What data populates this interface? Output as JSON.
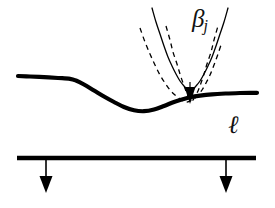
{
  "figure": {
    "background_color": "#ffffff",
    "ink_color": "#000000",
    "width": 275,
    "height": 208,
    "labels": {
      "beta_symbol": "β",
      "beta_subscript": "j",
      "beta_full": "βj",
      "ell": "ℓ"
    }
  },
  "chart_data": {
    "type": "line",
    "xlabel": "",
    "ylabel": "",
    "xlim": [
      0,
      275
    ],
    "ylim": [
      208,
      0
    ],
    "grid": false,
    "legend": "none",
    "coordinate_note": "Pixel coordinates, y increases downward",
    "annotations": [
      {
        "text": "βj",
        "x": 200,
        "y": 22,
        "style": "italic",
        "role": "parabola-family-label"
      },
      {
        "text": "ℓ",
        "x": 234,
        "y": 125,
        "style": "script-italic",
        "role": "baseline-label"
      }
    ],
    "series": [
      {
        "name": "obstacle-curve",
        "style": "solid",
        "stroke_width": 4.2,
        "color": "#000000",
        "points": [
          [
            18,
            76
          ],
          [
            30,
            76.5
          ],
          [
            44,
            77.2
          ],
          [
            58,
            78.0
          ],
          [
            70,
            78.8
          ],
          [
            76,
            80.5
          ],
          [
            84,
            84.5
          ],
          [
            94,
            90.5
          ],
          [
            104,
            96.5
          ],
          [
            114,
            102
          ],
          [
            124,
            107
          ],
          [
            134,
            110.3
          ],
          [
            144,
            111.2
          ],
          [
            154,
            109.5
          ],
          [
            164,
            106
          ],
          [
            174,
            102
          ],
          [
            182,
            99.5
          ],
          [
            190,
            97.3
          ],
          [
            200,
            95.6
          ],
          [
            212,
            94.3
          ],
          [
            226,
            93.5
          ],
          [
            240,
            93.0
          ],
          [
            250,
            92.8
          ],
          [
            257,
            92.8
          ]
        ]
      },
      {
        "name": "parabola-solid",
        "style": "solid",
        "stroke_width": 1.3,
        "color": "#000000",
        "vertex": [
          190,
          90
        ],
        "points": [
          [
            152,
            8
          ],
          [
            156,
            22
          ],
          [
            160,
            34
          ],
          [
            164,
            46
          ],
          [
            168,
            57
          ],
          [
            172,
            66
          ],
          [
            176,
            74
          ],
          [
            180,
            81
          ],
          [
            184,
            86
          ],
          [
            187,
            89
          ],
          [
            190,
            90
          ],
          [
            193,
            89
          ],
          [
            196,
            86
          ],
          [
            200,
            81
          ],
          [
            204,
            74
          ],
          [
            208,
            66
          ],
          [
            212,
            57
          ],
          [
            216,
            46
          ],
          [
            220,
            34
          ],
          [
            224,
            22
          ],
          [
            228,
            8
          ]
        ]
      },
      {
        "name": "parabola-dashed-wide",
        "style": "dashed",
        "dash_pattern": [
          5,
          4
        ],
        "stroke_width": 1.3,
        "color": "#000000",
        "vertex": [
          187,
          102
        ],
        "points": [
          [
            140,
            28
          ],
          [
            145,
            42
          ],
          [
            150,
            54
          ],
          [
            155,
            65
          ],
          [
            160,
            75
          ],
          [
            165,
            83
          ],
          [
            170,
            90
          ],
          [
            175,
            95
          ],
          [
            180,
            99
          ],
          [
            184,
            101
          ],
          [
            187,
            102
          ],
          [
            190,
            101
          ],
          [
            194,
            99
          ],
          [
            198,
            95
          ],
          [
            202,
            90
          ],
          [
            206,
            83
          ],
          [
            210,
            75
          ],
          [
            214,
            65
          ],
          [
            218,
            54
          ],
          [
            222,
            42
          ]
        ]
      },
      {
        "name": "parabola-dashed-narrow",
        "style": "dashed",
        "dash_pattern": [
          5,
          4
        ],
        "stroke_width": 1.3,
        "color": "#000000",
        "vertex": [
          191,
          101
        ],
        "points": [
          [
            166,
            26
          ],
          [
            170,
            40
          ],
          [
            173,
            52
          ],
          [
            177,
            64
          ],
          [
            180,
            74
          ],
          [
            183,
            83
          ],
          [
            186,
            91
          ],
          [
            188,
            96
          ],
          [
            190,
            100
          ],
          [
            191,
            101
          ],
          [
            193,
            100
          ],
          [
            195,
            96
          ],
          [
            198,
            91
          ],
          [
            201,
            83
          ],
          [
            204,
            74
          ],
          [
            207,
            64
          ],
          [
            211,
            52
          ],
          [
            214,
            40
          ],
          [
            218,
            26
          ]
        ]
      },
      {
        "name": "baseline",
        "style": "solid",
        "stroke_width": 4.5,
        "color": "#000000",
        "points": [
          [
            17,
            158
          ],
          [
            256,
            158
          ]
        ]
      }
    ],
    "arrows": [
      {
        "name": "tangency-arrow",
        "from": [
          190,
          82
        ],
        "to": [
          190,
          104
        ],
        "head": "solid-triangle",
        "head_width": 11,
        "head_length": 17,
        "shaft_width": 1.2
      },
      {
        "name": "baseline-arrow-left",
        "from": [
          46,
          158
        ],
        "to": [
          46,
          193
        ],
        "head": "solid-triangle",
        "head_width": 13,
        "head_length": 17,
        "shaft_width": 1.6
      },
      {
        "name": "baseline-arrow-right",
        "from": [
          226,
          158
        ],
        "to": [
          226,
          193
        ],
        "head": "solid-triangle",
        "head_width": 13,
        "head_length": 17,
        "shaft_width": 1.6
      }
    ]
  }
}
